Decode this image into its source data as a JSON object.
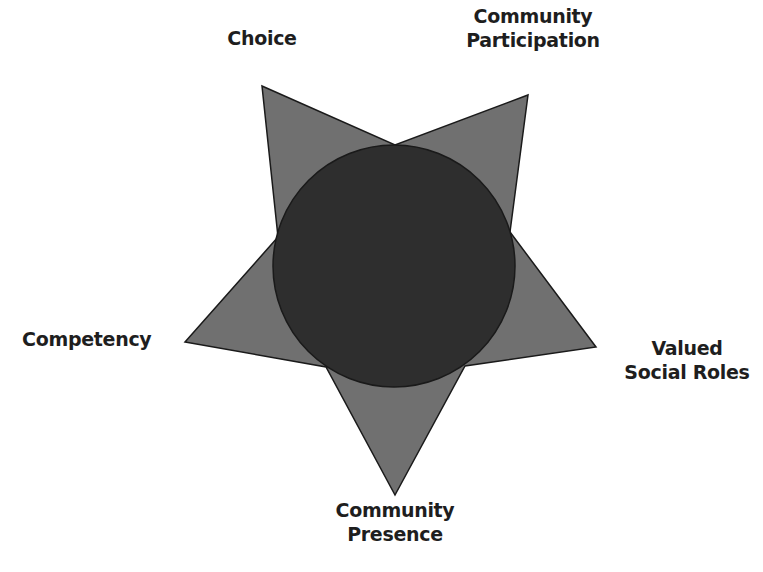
{
  "diagram": {
    "type": "star-with-central-circle",
    "colors": {
      "star_fill": "#707070",
      "circle_fill": "#2e2e2e",
      "outline": "#1a1a1a",
      "label_text": "#1e1e1e",
      "background": "#ffffff"
    },
    "points": [
      {
        "id": "choice",
        "lines": [
          "Choice"
        ]
      },
      {
        "id": "community-participation",
        "lines": [
          "Community",
          "Participation"
        ]
      },
      {
        "id": "valued-social-roles",
        "lines": [
          "Valued",
          "Social Roles"
        ]
      },
      {
        "id": "community-presence",
        "lines": [
          "Community",
          "Presence"
        ]
      },
      {
        "id": "competency",
        "lines": [
          "Competency"
        ]
      }
    ]
  }
}
